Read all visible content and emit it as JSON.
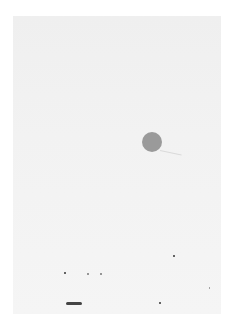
{
  "scene": {
    "description": "Photo of a nearly blank sheet of paper with a gray dot",
    "background_color": "#ffffff",
    "paper_color": "#f2f2f2",
    "dot_color": "#9a9a9a"
  }
}
